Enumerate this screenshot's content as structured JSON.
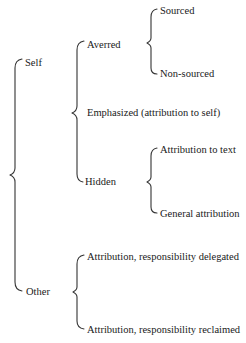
{
  "diagram": {
    "type": "taxonomy-brace-tree",
    "root": {
      "children": [
        {
          "label": "Self",
          "children": [
            {
              "label": "Averred",
              "children": [
                {
                  "label": "Sourced"
                },
                {
                  "label": "Non-sourced"
                }
              ]
            },
            {
              "label": "Emphasized (attribution to self)"
            },
            {
              "label": "Hidden",
              "children": [
                {
                  "label": "Attribution to text"
                },
                {
                  "label": "General attribution"
                }
              ]
            }
          ]
        },
        {
          "label": "Other",
          "children": [
            {
              "label": "Attribution, responsibility delegated"
            },
            {
              "label": "Attribution, responsibility reclaimed"
            }
          ]
        }
      ]
    }
  },
  "labels": {
    "self": "Self",
    "other": "Other",
    "averred": "Averred",
    "emphasized": "Emphasized (attribution to self)",
    "hidden": "Hidden",
    "sourced": "Sourced",
    "non_sourced": "Non-sourced",
    "attribution_to_text": "Attribution to text",
    "general_attribution": "General attribution",
    "delegated": "Attribution, responsibility delegated",
    "reclaimed": "Attribution, responsibility reclaimed"
  }
}
